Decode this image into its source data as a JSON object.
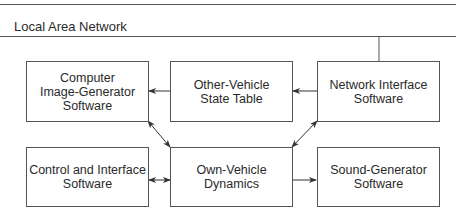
{
  "network": {
    "label": "Local Area Network"
  },
  "boxes": [
    {
      "id": "computer-image-generator",
      "label": "Computer\nImage-Generator\nSoftware"
    },
    {
      "id": "other-vehicle-state-table",
      "label": "Other-Vehicle\nState Table"
    },
    {
      "id": "network-interface",
      "label": "Network Interface\nSoftware"
    },
    {
      "id": "control-and-interface",
      "label": "Control and Interface\nSoftware"
    },
    {
      "id": "own-vehicle-dynamics",
      "label": "Own-Vehicle\nDynamics"
    },
    {
      "id": "sound-generator",
      "label": "Sound-Generator\nSoftware"
    }
  ],
  "connections": [
    {
      "from": "network-interface",
      "to": "local-area-network",
      "type": "line"
    },
    {
      "from": "network-interface",
      "to": "other-vehicle-state-table",
      "type": "arrow"
    },
    {
      "from": "other-vehicle-state-table",
      "to": "computer-image-generator",
      "type": "arrow"
    },
    {
      "from": "computer-image-generator",
      "to": "own-vehicle-dynamics",
      "type": "bidirectional"
    },
    {
      "from": "own-vehicle-dynamics",
      "to": "network-interface",
      "type": "bidirectional"
    },
    {
      "from": "control-and-interface",
      "to": "own-vehicle-dynamics",
      "type": "bidirectional"
    },
    {
      "from": "own-vehicle-dynamics",
      "to": "sound-generator",
      "type": "arrow"
    }
  ],
  "colors": {
    "line": "#555555",
    "text": "#2a2a2a",
    "background": "#ffffff"
  }
}
